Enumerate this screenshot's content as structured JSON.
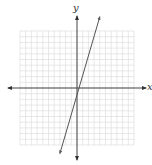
{
  "chart_data": {
    "type": "line",
    "title": "",
    "xlabel": "x",
    "ylabel": "y",
    "grid": true,
    "grid_cells": {
      "x": 20,
      "y": 20
    },
    "xlim": [
      -10,
      10
    ],
    "ylim": [
      -10,
      10
    ],
    "axes_arrows": true,
    "series": [
      {
        "name": "line",
        "points": [
          [
            -3,
            -11.5
          ],
          [
            4,
            12.5
          ]
        ],
        "slope": 3.5,
        "y_intercept": -1
      }
    ]
  },
  "labels": {
    "x_axis": "x",
    "y_axis": "y"
  },
  "colors": {
    "grid": "#d9d9d9",
    "axis": "#444444",
    "line": "#555555",
    "background": "#ffffff"
  }
}
